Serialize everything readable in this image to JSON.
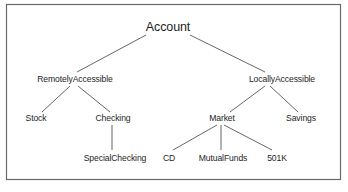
{
  "diagram": {
    "type": "tree",
    "title": "",
    "colors": {
      "frame": "#6a6a6a",
      "edge": "#555555",
      "text": "#1e1e1e",
      "background": "#ffffff"
    },
    "nodes": [
      {
        "id": "account",
        "label": "Account",
        "level": 0
      },
      {
        "id": "remotely",
        "label": "RemotelyAccessible",
        "level": 1,
        "parent": "account"
      },
      {
        "id": "locally",
        "label": "LocallyAccessible",
        "level": 1,
        "parent": "account"
      },
      {
        "id": "stock",
        "label": "Stock",
        "level": 2,
        "parent": "remotely"
      },
      {
        "id": "checking",
        "label": "Checking",
        "level": 2,
        "parent": "remotely"
      },
      {
        "id": "market",
        "label": "Market",
        "level": 2,
        "parent": "locally"
      },
      {
        "id": "savings",
        "label": "Savings",
        "level": 2,
        "parent": "locally"
      },
      {
        "id": "specialchecking",
        "label": "SpecialChecking",
        "level": 3,
        "parent": "checking"
      },
      {
        "id": "cd",
        "label": "CD",
        "level": 3,
        "parent": "market"
      },
      {
        "id": "mutualfunds",
        "label": "MutualFunds",
        "level": 3,
        "parent": "market"
      },
      {
        "id": "501k",
        "label": "501K",
        "level": 3,
        "parent": "market"
      }
    ],
    "edges": [
      {
        "from": "account",
        "to": "remotely"
      },
      {
        "from": "account",
        "to": "locally"
      },
      {
        "from": "remotely",
        "to": "stock"
      },
      {
        "from": "remotely",
        "to": "checking"
      },
      {
        "from": "checking",
        "to": "specialchecking"
      },
      {
        "from": "locally",
        "to": "market"
      },
      {
        "from": "locally",
        "to": "savings"
      },
      {
        "from": "market",
        "to": "cd"
      },
      {
        "from": "market",
        "to": "mutualfunds"
      },
      {
        "from": "market",
        "to": "501k"
      }
    ]
  }
}
